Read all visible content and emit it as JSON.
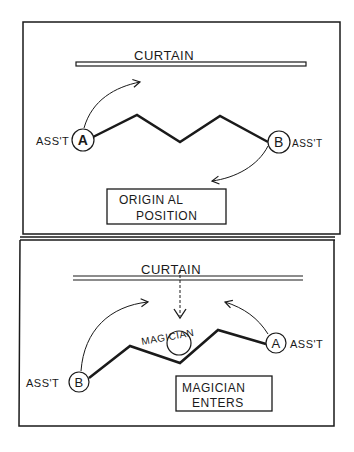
{
  "panels": [
    {
      "curtain_label": "CURTAIN",
      "left_assistant": {
        "letter": "A",
        "label": "ASS'T"
      },
      "right_assistant": {
        "letter": "B",
        "label": "ASS'T"
      },
      "caption_line1": "ORIGIN AL",
      "caption_line2": "POSITION"
    },
    {
      "curtain_label": "CURTAIN",
      "left_assistant": {
        "letter": "B",
        "label": "ASS'T"
      },
      "right_assistant": {
        "letter": "A",
        "label": "ASS'T"
      },
      "magician_label": "MAGICIAN",
      "caption_line1": "MAGICIAN",
      "caption_line2": "ENTERS"
    }
  ],
  "colors": {
    "ink": "#1a1a1a",
    "paper": "#ffffff"
  }
}
